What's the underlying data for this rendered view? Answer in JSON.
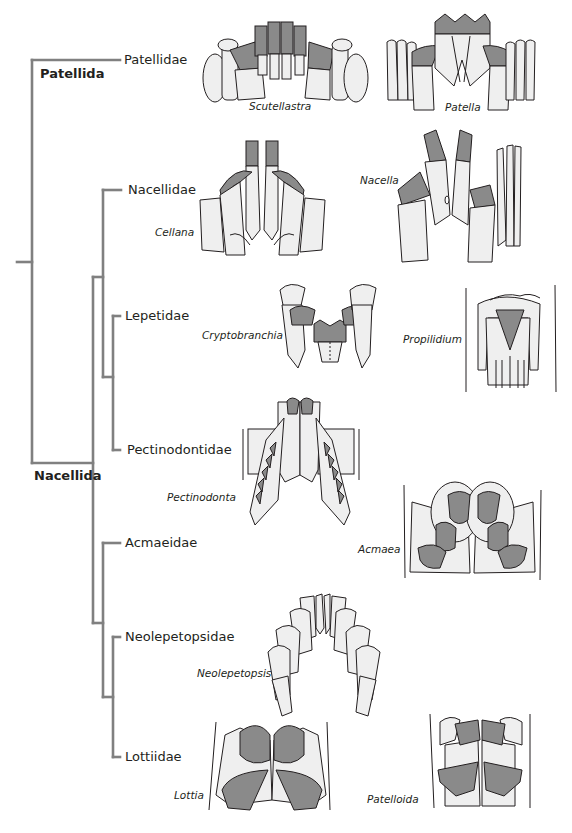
{
  "figure": {
    "orders": [
      {
        "id": "patellida",
        "label": "Patellida"
      },
      {
        "id": "nacellida",
        "label": "Nacellida"
      }
    ],
    "families": [
      {
        "id": "patellidae",
        "label": "Patellidae",
        "genera": [
          "Scutellastra",
          "Patella"
        ]
      },
      {
        "id": "nacellidae",
        "label": "Nacellidae",
        "genera": [
          "Cellana",
          "Nacella"
        ]
      },
      {
        "id": "lepetidae",
        "label": "Lepetidae",
        "genera": [
          "Cryptobranchia",
          "Propilidium"
        ]
      },
      {
        "id": "pectinodontidae",
        "label": "Pectinodontidae",
        "genera": [
          "Pectinodonta"
        ]
      },
      {
        "id": "acmaeidae",
        "label": "Acmaeidae",
        "genera": [
          "Acmaea"
        ]
      },
      {
        "id": "neolepetopsidae",
        "label": "Neolepetopsidae",
        "genera": [
          "Neolepetopsis"
        ]
      },
      {
        "id": "lottiidae",
        "label": "Lottiidae",
        "genera": [
          "Lottia",
          "Patelloida"
        ]
      }
    ],
    "genera": {
      "scutellastra": "Scutellastra",
      "patella": "Patella",
      "cellana": "Cellana",
      "nacella": "Nacella",
      "cryptobranchia": "Cryptobranchia",
      "propilidium": "Propilidium",
      "pectinodonta": "Pectinodonta",
      "acmaea": "Acmaea",
      "neolepetopsis": "Neolepetopsis",
      "lottia": "Lottia",
      "patelloida": "Patelloida"
    },
    "tree": {
      "topology": "(Patellidae,((Nacellidae,(Lepetidae,Pectinodontidae)),(Acmaeidae,(Neolepetopsidae,Lottiidae))))",
      "branch_color": "#808080"
    },
    "colors": {
      "tooth_fill_light": "#efefef",
      "tooth_fill_dark": "#8a8a8a",
      "outline": "#231f20"
    }
  }
}
